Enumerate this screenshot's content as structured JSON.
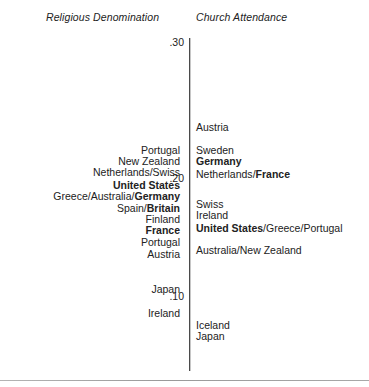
{
  "chart_data": {
    "type": "scatter",
    "title": "",
    "subtitle": "",
    "xlabel": "",
    "ylabel": "",
    "orientation": "vertical-shared-scale",
    "grid": false,
    "legend_position": "none",
    "axis": {
      "ticks": [
        {
          "label": ".30",
          "value": 0.3
        },
        {
          "label": ".20",
          "value": 0.2
        },
        {
          "label": ".10",
          "value": 0.1
        }
      ],
      "ylim": [
        0.055,
        0.32
      ]
    },
    "columns": [
      {
        "name": "Religious Denomination",
        "align": "right",
        "points": [
          {
            "label": "Portugal",
            "value": 0.231,
            "bold_parts": []
          },
          {
            "label": "New Zealand",
            "value": 0.222,
            "bold_parts": []
          },
          {
            "label": "Netherlands/Swiss",
            "value": 0.213,
            "bold_parts": []
          },
          {
            "label": "United States",
            "value": 0.203,
            "bold_parts": [
              "United States"
            ]
          },
          {
            "label": "Greece/Australia/Germany",
            "value": 0.194,
            "bold_parts": [
              "Germany"
            ]
          },
          {
            "label": "Spain/Britain",
            "value": 0.185,
            "bold_parts": [
              "Britain"
            ]
          },
          {
            "label": "Finland",
            "value": 0.176,
            "bold_parts": []
          },
          {
            "label": "France",
            "value": 0.167,
            "bold_parts": [
              "France"
            ]
          },
          {
            "label": "Portugal",
            "value": 0.158,
            "bold_parts": []
          },
          {
            "label": "Austria",
            "value": 0.148,
            "bold_parts": []
          },
          {
            "label": "Japan",
            "value": 0.12,
            "bold_parts": []
          },
          {
            "label": "Ireland",
            "value": 0.101,
            "bold_parts": []
          }
        ]
      },
      {
        "name": "Church Attendance",
        "align": "left",
        "points": [
          {
            "label": "Austria",
            "value": 0.249,
            "bold_parts": []
          },
          {
            "label": "Sweden",
            "value": 0.231,
            "bold_parts": []
          },
          {
            "label": "Germany",
            "value": 0.222,
            "bold_parts": [
              "Germany"
            ]
          },
          {
            "label": "Netherlands/France",
            "value": 0.212,
            "bold_parts": [
              "France"
            ]
          },
          {
            "label": "Swiss",
            "value": 0.188,
            "bold_parts": []
          },
          {
            "label": "Ireland",
            "value": 0.179,
            "bold_parts": []
          },
          {
            "label": "United States/Greece/Portugal",
            "value": 0.169,
            "bold_parts": [
              "United States"
            ]
          },
          {
            "label": "Australia/New Zealand",
            "value": 0.151,
            "bold_parts": []
          },
          {
            "label": "Iceland",
            "value": 0.092,
            "bold_parts": []
          },
          {
            "label": "Japan",
            "value": 0.083,
            "bold_parts": []
          }
        ]
      }
    ]
  },
  "headers": {
    "left": "Religious Denomination",
    "right": "Church Attendance"
  },
  "ticks": {
    "t30": ".30",
    "t20": ".20",
    "t10": ".10"
  },
  "colors": {
    "text": "#222222",
    "axis": "#4a4a4a",
    "rule": "#a0a0a0",
    "background": "#ffffff"
  }
}
